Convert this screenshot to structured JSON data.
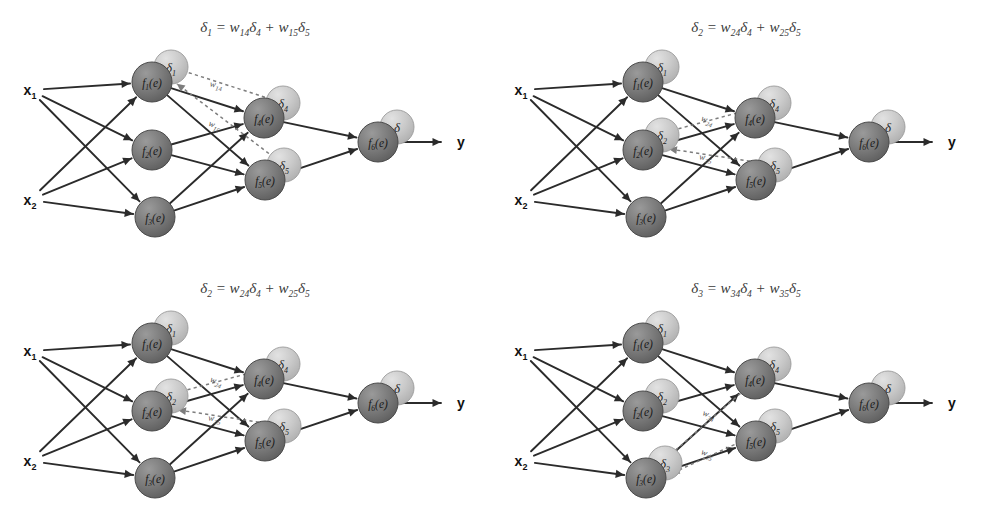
{
  "figure": {
    "panel_count": 4,
    "background_color": "#ffffff",
    "node_fill_color": "#6e6e6e",
    "delta_fill_color": "#c8c8c8",
    "edge_color": "#2b2b2b",
    "dashed_edge_color": "#7d7d7d"
  },
  "labels": {
    "input_1": "x",
    "input_1_sub": "1",
    "input_2": "x",
    "input_2_sub": "2",
    "output": "y",
    "f": "f",
    "of_e": "(e)",
    "delta": "δ",
    "equals": "=",
    "plus": "+",
    "w": "w"
  },
  "nodes": [
    {
      "id": "n1",
      "label": "f",
      "sub": "1",
      "arg": "(e)",
      "layer": "hidden1"
    },
    {
      "id": "n2",
      "label": "f",
      "sub": "2",
      "arg": "(e)",
      "layer": "hidden1"
    },
    {
      "id": "n3",
      "label": "f",
      "sub": "3",
      "arg": "(e)",
      "layer": "hidden1"
    },
    {
      "id": "n4",
      "label": "f",
      "sub": "4",
      "arg": "(e)",
      "layer": "hidden2"
    },
    {
      "id": "n5",
      "label": "f",
      "sub": "5",
      "arg": "(e)",
      "layer": "hidden2"
    },
    {
      "id": "n6",
      "label": "f",
      "sub": "6",
      "arg": "(e)",
      "layer": "output"
    }
  ],
  "panels": [
    {
      "id": "panel-1",
      "position": "top-left",
      "equation": {
        "lhs": "δ",
        "lhs_sub": "1",
        "term1_w": "w",
        "term1_w_sub": "14",
        "term1_d": "δ",
        "term1_d_sub": "4",
        "term2_w": "w",
        "term2_w_sub": "15",
        "term2_d": "δ",
        "term2_d_sub": "5",
        "text": "δ₁ = w₁₄δ₄ + w₁₅δ₅"
      },
      "target_node": "n1",
      "weight_labels": [
        {
          "w": "w",
          "sub": "14"
        },
        {
          "w": "w",
          "sub": "15"
        }
      ],
      "deltas_shown": [
        {
          "node": "n1",
          "d": "δ",
          "sub": "1"
        },
        {
          "node": "n4",
          "d": "δ",
          "sub": "4"
        },
        {
          "node": "n5",
          "d": "δ",
          "sub": "5"
        },
        {
          "node": "n6",
          "d": "δ",
          "sub": ""
        }
      ]
    },
    {
      "id": "panel-2",
      "position": "top-right",
      "equation": {
        "lhs": "δ",
        "lhs_sub": "2",
        "term1_w": "w",
        "term1_w_sub": "24",
        "term1_d": "δ",
        "term1_d_sub": "4",
        "term2_w": "w",
        "term2_w_sub": "25",
        "term2_d": "δ",
        "term2_d_sub": "5",
        "text": "δ₂ = w₂₄δ₄ + w₂₅δ₅"
      },
      "target_node": "n2",
      "weight_labels": [
        {
          "w": "w",
          "sub": "24"
        },
        {
          "w": "w",
          "sub": "25"
        }
      ],
      "deltas_shown": [
        {
          "node": "n1",
          "d": "δ",
          "sub": "1"
        },
        {
          "node": "n2",
          "d": "δ",
          "sub": "2"
        },
        {
          "node": "n4",
          "d": "δ",
          "sub": "4"
        },
        {
          "node": "n5",
          "d": "δ",
          "sub": "5"
        },
        {
          "node": "n6",
          "d": "δ",
          "sub": ""
        }
      ]
    },
    {
      "id": "panel-3",
      "position": "bottom-left",
      "equation": {
        "lhs": "δ",
        "lhs_sub": "2",
        "term1_w": "w",
        "term1_w_sub": "24",
        "term1_d": "δ",
        "term1_d_sub": "4",
        "term2_w": "w",
        "term2_w_sub": "25",
        "term2_d": "δ",
        "term2_d_sub": "5",
        "text": "δ₂ = w₂₄δ₄ + w₂₅δ₅"
      },
      "target_node": "n2",
      "weight_labels": [
        {
          "w": "w",
          "sub": "24"
        },
        {
          "w": "w",
          "sub": "25"
        }
      ],
      "deltas_shown": [
        {
          "node": "n1",
          "d": "δ",
          "sub": "1"
        },
        {
          "node": "n2",
          "d": "δ",
          "sub": "2"
        },
        {
          "node": "n4",
          "d": "δ",
          "sub": "4"
        },
        {
          "node": "n5",
          "d": "δ",
          "sub": "5"
        },
        {
          "node": "n6",
          "d": "δ",
          "sub": ""
        }
      ]
    },
    {
      "id": "panel-4",
      "position": "bottom-right",
      "equation": {
        "lhs": "δ",
        "lhs_sub": "3",
        "term1_w": "w",
        "term1_w_sub": "34",
        "term1_d": "δ",
        "term1_d_sub": "4",
        "term2_w": "w",
        "term2_w_sub": "35",
        "term2_d": "δ",
        "term2_d_sub": "5",
        "text": "δ₃ = w₃₄δ₄ + w₃₅δ₅"
      },
      "target_node": "n3",
      "weight_labels": [
        {
          "w": "w",
          "sub": "34"
        },
        {
          "w": "w",
          "sub": "35"
        }
      ],
      "deltas_shown": [
        {
          "node": "n1",
          "d": "δ",
          "sub": "1"
        },
        {
          "node": "n2",
          "d": "δ",
          "sub": "2"
        },
        {
          "node": "n3",
          "d": "δ",
          "sub": "3"
        },
        {
          "node": "n4",
          "d": "δ",
          "sub": "4"
        },
        {
          "node": "n5",
          "d": "δ",
          "sub": "5"
        },
        {
          "node": "n6",
          "d": "δ",
          "sub": ""
        }
      ]
    }
  ],
  "geometry": {
    "node_radius": 20,
    "delta_radius": 17,
    "positions": {
      "x1": [
        30,
        90
      ],
      "x2": [
        30,
        200
      ],
      "n1": [
        152,
        82
      ],
      "n2": [
        152,
        150
      ],
      "n3": [
        155,
        217
      ],
      "n4": [
        264,
        118
      ],
      "n5": [
        265,
        180
      ],
      "n6": [
        378,
        142
      ],
      "y": [
        455,
        142
      ]
    }
  }
}
